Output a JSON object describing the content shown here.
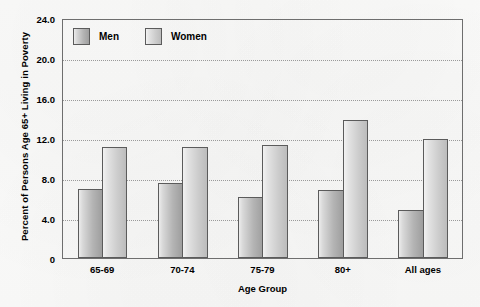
{
  "chart_data": {
    "type": "bar",
    "title": "",
    "xlabel": "Age Group",
    "ylabel": "Percent of Persons Age 65+ Living in Poverty",
    "categories": [
      "65-69",
      "70-74",
      "75-79",
      "80+",
      "All ages"
    ],
    "series": [
      {
        "name": "Men",
        "values": [
          6.9,
          7.5,
          6.1,
          6.8,
          4.8
        ]
      },
      {
        "name": "Women",
        "values": [
          11.1,
          11.1,
          11.3,
          13.8,
          11.9
        ]
      }
    ],
    "ylim": [
      0,
      24
    ],
    "ytick_values": [
      0,
      4,
      8,
      12,
      16,
      20,
      24
    ],
    "ytick_labels": [
      "0",
      "4.0",
      "8.0",
      "12.0",
      "16.0",
      "20.0",
      "24.0"
    ],
    "grid": true,
    "grid_style": "dotted",
    "legend_position": "top-left",
    "colors": {
      "men_fill_light": "#ececec",
      "men_fill_dark": "#9e9e9e",
      "women_fill_light": "#f2f2f2",
      "women_fill_dark": "#bcbcbc",
      "bar_border": "#5b5b5b",
      "gridline": "#9a9a9a",
      "axis": "#6e6e6e",
      "background": "#fbfbfa",
      "text": "#000000"
    }
  }
}
